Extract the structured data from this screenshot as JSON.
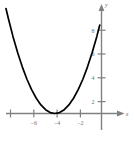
{
  "chart_data": {
    "type": "line",
    "title": "",
    "subtitle": "",
    "xlabel": "x",
    "ylabel": "y",
    "xlim": [
      -8.6,
      -0.5
    ],
    "ylim": [
      -1.6,
      9.4
    ],
    "grid": false,
    "legend": null,
    "x_ticks": [
      -6,
      -4,
      -2
    ],
    "x_tick_labels": [
      "−6",
      "−4",
      "−2"
    ],
    "y_ticks": [
      2,
      4,
      6,
      8
    ],
    "y_tick_labels": [
      "2",
      "4",
      "6",
      "8"
    ],
    "equation": "y = 0.5(x + 4)²",
    "vertex": [
      -4,
      0
    ],
    "series": [
      {
        "name": "parabola",
        "color": "#000000",
        "x": [
          -8.2,
          -8.0,
          -7.6,
          -7.2,
          -6.8,
          -6.4,
          -6.0,
          -5.6,
          -5.2,
          -4.8,
          -4.4,
          -4.0,
          -3.6,
          -3.2,
          -2.8,
          -2.4,
          -2.0,
          -1.6,
          -1.2,
          -0.8,
          -0.4,
          -0.15
        ],
        "y": [
          8.82,
          8.0,
          6.48,
          5.12,
          3.92,
          2.88,
          2.0,
          1.28,
          0.72,
          0.32,
          0.08,
          0.0,
          0.08,
          0.32,
          0.72,
          1.28,
          2.0,
          2.88,
          3.92,
          5.12,
          6.48,
          7.43
        ]
      }
    ]
  },
  "axes": {
    "x_axis_name": "x",
    "y_axis_name": "y",
    "axis_color": "#808080",
    "curve_color": "#000000",
    "background": "#ffffff"
  }
}
